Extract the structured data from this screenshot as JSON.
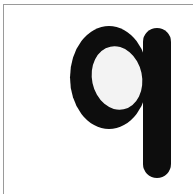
{
  "image": {
    "kind": "scanned-letter-card",
    "width": 193,
    "height": 194,
    "background_color": "#ffffff",
    "description": "Scanned white card showing a single printed lowercase letter"
  },
  "border": {
    "top_rule_color": "#9a9a9a",
    "left_rule_color": "#9a9a9a",
    "bottom_rule": "none",
    "right_rule": "none"
  },
  "glyph": {
    "character": "q",
    "case": "lowercase",
    "script": "Latin",
    "ink_color": "#0d0d0d",
    "counter_color": "#ffffff",
    "style": "heavy rounded sans-serif",
    "bowl": {
      "left": 70,
      "top": 26,
      "right": 148,
      "bottom": 129
    },
    "stem": {
      "left": 143,
      "top": 28,
      "right": 171,
      "bottom": 178
    },
    "counter": {
      "center_x": 117,
      "center_y": 78,
      "radius_x": 25,
      "radius_y": 32,
      "rotation_deg": -12
    }
  }
}
